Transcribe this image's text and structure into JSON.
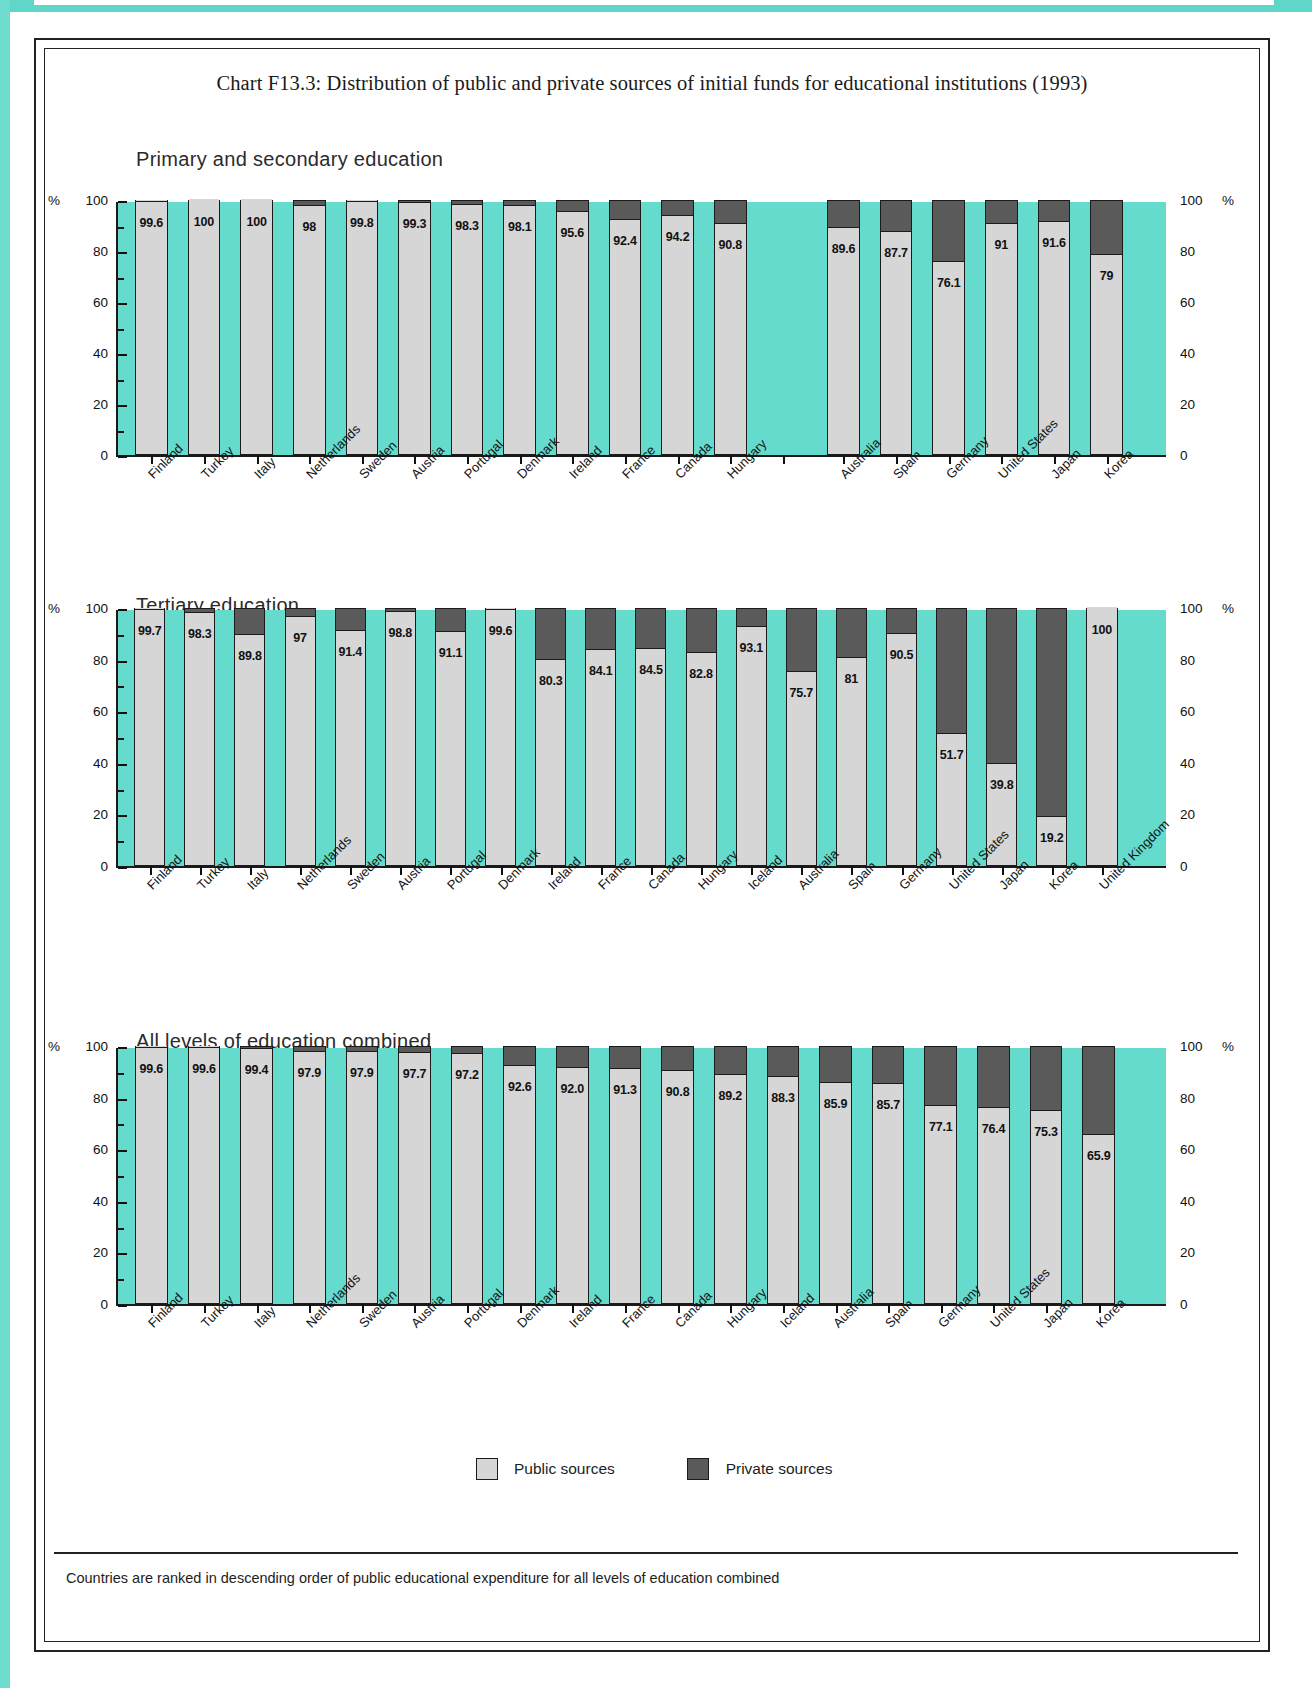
{
  "title": "Chart F13.3: Distribution of public and private sources of initial funds for educational institutions (1993)",
  "axis": {
    "percent_symbol": "%",
    "ticks": [
      "100",
      "80",
      "60",
      "40",
      "20",
      "0"
    ]
  },
  "legend": {
    "public_label": "Public sources",
    "private_label": "Private sources",
    "public_color": "#d6d6d6",
    "private_color": "#5a5a5a"
  },
  "footnote": "Countries are ranked in descending order of public educational expenditure for all levels of education combined",
  "colors": {
    "teal": "#65dbcd",
    "public": "#d6d6d6",
    "private": "#5a5a5a",
    "outline": "#1b1b1b"
  },
  "chart_data": [
    {
      "type": "bar",
      "title": "Primary and secondary education",
      "xlabel": "",
      "ylabel": "%",
      "ylim": [
        0,
        100
      ],
      "grid": false,
      "stacked": true,
      "series": [
        {
          "name": "Public sources",
          "values": [
            99.6,
            100,
            100,
            98,
            99.8,
            99.3,
            98.3,
            98.1,
            95.6,
            92.4,
            94.2,
            90.8,
            null,
            89.6,
            87.7,
            76.1,
            91,
            91.6,
            79
          ]
        },
        {
          "name": "Private sources",
          "values": [
            0.4,
            0,
            0,
            2,
            0.2,
            0.7,
            1.7,
            1.9,
            4.4,
            7.6,
            5.8,
            9.2,
            null,
            10.4,
            12.3,
            23.9,
            9,
            8.4,
            21
          ]
        }
      ],
      "categories": [
        "Finland",
        "Turkey",
        "Italy",
        "Netherlands",
        "Sweden",
        "Austria",
        "Portugal",
        "Denmark",
        "Ireland",
        "France",
        "Canada",
        "Hungary",
        "",
        "Australia",
        "Spain",
        "Germany",
        "United States",
        "Japan",
        "Korea"
      ],
      "labels": [
        "99.6",
        "100",
        "100",
        "98",
        "99.8",
        "99.3",
        "98.3",
        "98.1",
        "95.6",
        "92.4",
        "94.2",
        "90.8",
        "",
        "89.6",
        "87.7",
        "76.1",
        "91",
        "91.6",
        "79"
      ]
    },
    {
      "type": "bar",
      "title": "Tertiary education",
      "xlabel": "",
      "ylabel": "%",
      "ylim": [
        0,
        100
      ],
      "grid": false,
      "stacked": true,
      "series": [
        {
          "name": "Public sources",
          "values": [
            99.7,
            98.3,
            89.8,
            97,
            91.4,
            98.8,
            91.1,
            99.6,
            80.3,
            84.1,
            84.5,
            82.8,
            93.1,
            75.7,
            81,
            90.5,
            51.7,
            39.8,
            19.2,
            100
          ]
        },
        {
          "name": "Private sources",
          "values": [
            0.3,
            1.7,
            10.2,
            3,
            8.6,
            1.2,
            8.9,
            0.4,
            19.7,
            15.9,
            15.5,
            17.2,
            6.9,
            24.3,
            19,
            9.5,
            48.3,
            60.2,
            80.8,
            0
          ]
        }
      ],
      "categories": [
        "Finland",
        "Turkey",
        "Italy",
        "Netherlands",
        "Sweden",
        "Austria",
        "Portugal",
        "Denmark",
        "Ireland",
        "France",
        "Canada",
        "Hungary",
        "Iceland",
        "Australia",
        "Spain",
        "Germany",
        "United States",
        "Japan",
        "Korea",
        "United Kingdom"
      ],
      "labels": [
        "99.7",
        "98.3",
        "89.8",
        "97",
        "91.4",
        "98.8",
        "91.1",
        "99.6",
        "80.3",
        "84.1",
        "84.5",
        "82.8",
        "93.1",
        "75.7",
        "81",
        "90.5",
        "51.7",
        "39.8",
        "19.2",
        "100"
      ]
    },
    {
      "type": "bar",
      "title": "All levels of education combined",
      "xlabel": "",
      "ylabel": "%",
      "ylim": [
        0,
        100
      ],
      "grid": false,
      "stacked": true,
      "series": [
        {
          "name": "Public sources",
          "values": [
            99.6,
            99.6,
            99.4,
            97.9,
            97.9,
            97.7,
            97.2,
            92.6,
            92.0,
            91.3,
            90.8,
            89.2,
            88.3,
            85.9,
            85.7,
            77.1,
            76.4,
            75.3,
            65.9
          ]
        },
        {
          "name": "Private sources",
          "values": [
            0.4,
            0.4,
            0.6,
            2.1,
            2.1,
            2.3,
            2.8,
            7.4,
            8.0,
            8.7,
            9.2,
            10.8,
            11.7,
            14.1,
            14.3,
            22.9,
            23.6,
            24.7,
            34.1
          ]
        }
      ],
      "categories": [
        "Finland",
        "Turkey",
        "Italy",
        "Netherlands",
        "Sweden",
        "Austria",
        "Portugal",
        "Denmark",
        "Ireland",
        "France",
        "Canada",
        "Hungary",
        "Iceland",
        "Australia",
        "Spain",
        "Germany",
        "United States",
        "Japan",
        "Korea"
      ],
      "labels": [
        "99.6",
        "99.6",
        "99.4",
        "97.9",
        "97.9",
        "97.7",
        "97.2",
        "92.6",
        "92.0",
        "91.3",
        "90.8",
        "89.2",
        "88.3",
        "85.9",
        "85.7",
        "77.1",
        "76.4",
        "75.3",
        "65.9"
      ]
    }
  ]
}
